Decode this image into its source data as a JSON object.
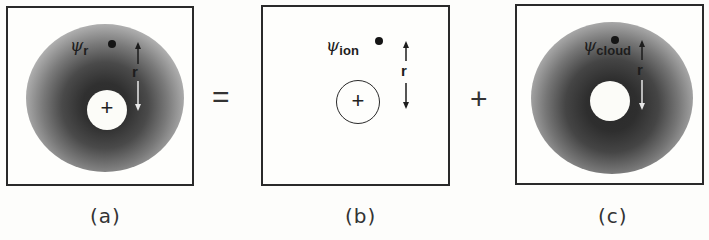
{
  "figure": {
    "panels": [
      {
        "id": "a",
        "caption": "(a)",
        "psi_symbol": "ψ",
        "psi_subscript": "r",
        "r_label": "r",
        "center_symbol": "+",
        "description": "ion plus electron cloud (total)"
      },
      {
        "id": "b",
        "caption": "(b)",
        "psi_symbol": "ψ",
        "psi_subscript": "ion",
        "r_label": "r",
        "center_symbol": "+",
        "description": "bare ion"
      },
      {
        "id": "c",
        "caption": "(c)",
        "psi_symbol": "ψ",
        "psi_subscript": "cloud",
        "r_label": "r",
        "center_symbol": "",
        "description": "screening electron cloud"
      }
    ],
    "operators": [
      "=",
      "+"
    ],
    "colors": {
      "frame": "#2a2a2a",
      "cloud_dark": "#3a3a3a",
      "cloud_light": "#cfcfcf",
      "background": "#fdfdfb"
    }
  }
}
